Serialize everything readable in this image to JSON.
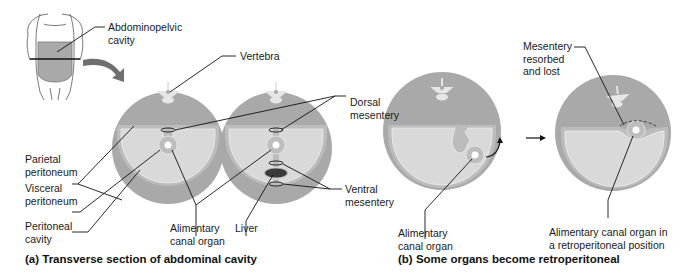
{
  "figure": {
    "colors": {
      "outer_disc": "#a9a9a9",
      "parietal_band": "#bcbcbc",
      "cavity": "#d9d9d9",
      "organ_ring": "#bdbdbd",
      "organ_lumen": "#ffffff",
      "liver": "#3a3a3a",
      "leader_line": "#111111",
      "arrow_big": "#6f6f6f"
    },
    "icons": [
      "body-torso-icon",
      "curved-arrow-icon",
      "vertebra-icon",
      "right-arrow-icon"
    ]
  },
  "panel_a": {
    "caption": "(a) Transverse section of abdominal cavity",
    "labels": {
      "abdominopelvic": "Abdominopelvic\ncavity",
      "vertebra": "Vertebra",
      "dorsal_mesentery": "Dorsal\nmesentery",
      "parietal_peritoneum": "Parietal\nperitoneum",
      "visceral_peritoneum": "Visceral\nperitoneum",
      "peritoneal_cavity": "Peritoneal\ncavity",
      "alimentary_canal_organ": "Alimentary\ncanal organ",
      "liver": "Liver",
      "ventral_mesentery": "Ventral\nmesentery"
    }
  },
  "panel_b": {
    "caption": "(b) Some organs become retroperitoneal",
    "labels": {
      "mesentery_resorbed": "Mesentery\nresorbed\nand lost",
      "alimentary_canal_organ": "Alimentary\ncanal organ",
      "retroperitoneal_position": "Alimentary canal organ in\na retroperitoneal position"
    }
  }
}
